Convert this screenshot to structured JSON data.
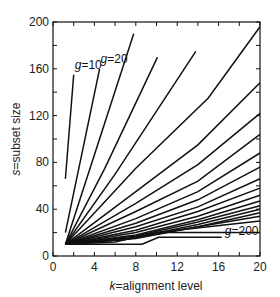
{
  "chart_data": {
    "type": "line",
    "title": "",
    "xlabel": "k = alignment level",
    "ylabel": "s = subset size",
    "xlim": [
      0,
      20
    ],
    "ylim": [
      0,
      200
    ],
    "xticks": [
      0,
      4,
      8,
      12,
      16,
      20
    ],
    "yticks": [
      0,
      40,
      80,
      120,
      160,
      200
    ],
    "grid": false,
    "legend": "none",
    "annotations": [
      {
        "text": "g = 10",
        "x": 2.1,
        "y": 160
      },
      {
        "text": "g = 20",
        "x": 4.6,
        "y": 165
      },
      {
        "text": "g = 200",
        "x": 16.6,
        "y": 18
      }
    ],
    "series": [
      {
        "name": "g=10",
        "x": [
          1.2,
          2.0
        ],
        "y": [
          66,
          155
        ]
      },
      {
        "name": "g=20",
        "x": [
          1.2,
          4.5
        ],
        "y": [
          20,
          160
        ]
      },
      {
        "name": "g=30",
        "x": [
          1.2,
          7.8
        ],
        "y": [
          10,
          190
        ]
      },
      {
        "name": "g=40",
        "x": [
          1.2,
          5,
          10.1
        ],
        "y": [
          10,
          75,
          170
        ]
      },
      {
        "name": "g=50",
        "x": [
          1.2,
          6,
          13.8
        ],
        "y": [
          10,
          70,
          175
        ]
      },
      {
        "name": "g=60",
        "x": [
          1.2,
          8,
          15,
          20
        ],
        "y": [
          10,
          75,
          135,
          196
        ]
      },
      {
        "name": "g=70",
        "x": [
          1.2,
          8,
          14,
          20
        ],
        "y": [
          10,
          55,
          95,
          148
        ]
      },
      {
        "name": "g=80",
        "x": [
          1.2,
          8,
          14,
          20
        ],
        "y": [
          10,
          45,
          78,
          122
        ]
      },
      {
        "name": "g=90",
        "x": [
          1.2,
          8,
          14,
          20
        ],
        "y": [
          10,
          38,
          64,
          104
        ]
      },
      {
        "name": "g=100",
        "x": [
          1.2,
          8,
          14,
          20
        ],
        "y": [
          10,
          32,
          55,
          88
        ]
      },
      {
        "name": "g=110",
        "x": [
          1.2,
          8,
          14,
          20
        ],
        "y": [
          10,
          28,
          48,
          76
        ]
      },
      {
        "name": "g=120",
        "x": [
          1.2,
          8,
          14,
          20
        ],
        "y": [
          10,
          25,
          42,
          66
        ]
      },
      {
        "name": "g=130",
        "x": [
          1.2,
          8,
          14,
          20
        ],
        "y": [
          10,
          22,
          38,
          58
        ]
      },
      {
        "name": "g=140",
        "x": [
          1.2,
          8,
          14,
          20
        ],
        "y": [
          10,
          20,
          34,
          52
        ]
      },
      {
        "name": "g=150",
        "x": [
          1.2,
          8,
          14,
          20
        ],
        "y": [
          10,
          18,
          31,
          47
        ]
      },
      {
        "name": "g=160",
        "x": [
          1.2,
          8,
          14,
          20
        ],
        "y": [
          10,
          17,
          29,
          43
        ]
      },
      {
        "name": "g=170",
        "x": [
          1.2,
          8,
          14,
          20
        ],
        "y": [
          10,
          16,
          27,
          40
        ]
      },
      {
        "name": "g=180",
        "x": [
          1.2,
          8,
          14,
          20
        ],
        "y": [
          10,
          15,
          25,
          37
        ]
      },
      {
        "name": "g=190",
        "x": [
          1.2,
          7,
          12,
          20
        ],
        "y": [
          10,
          14,
          22,
          34
        ]
      },
      {
        "name": "g=200",
        "x": [
          1.2,
          6,
          10,
          20
        ],
        "y": [
          10,
          12,
          20,
          30
        ]
      }
    ],
    "boundary_lines": [
      {
        "name": "floor",
        "x": [
          1.2,
          8.6
        ],
        "y": [
          10,
          10
        ]
      },
      {
        "name": "floor-ramp",
        "x": [
          8.6,
          10.2,
          16.3
        ],
        "y": [
          10,
          16,
          16
        ]
      },
      {
        "name": "upper-flat",
        "x": [
          10.2,
          20
        ],
        "y": [
          20,
          20
        ]
      }
    ]
  }
}
